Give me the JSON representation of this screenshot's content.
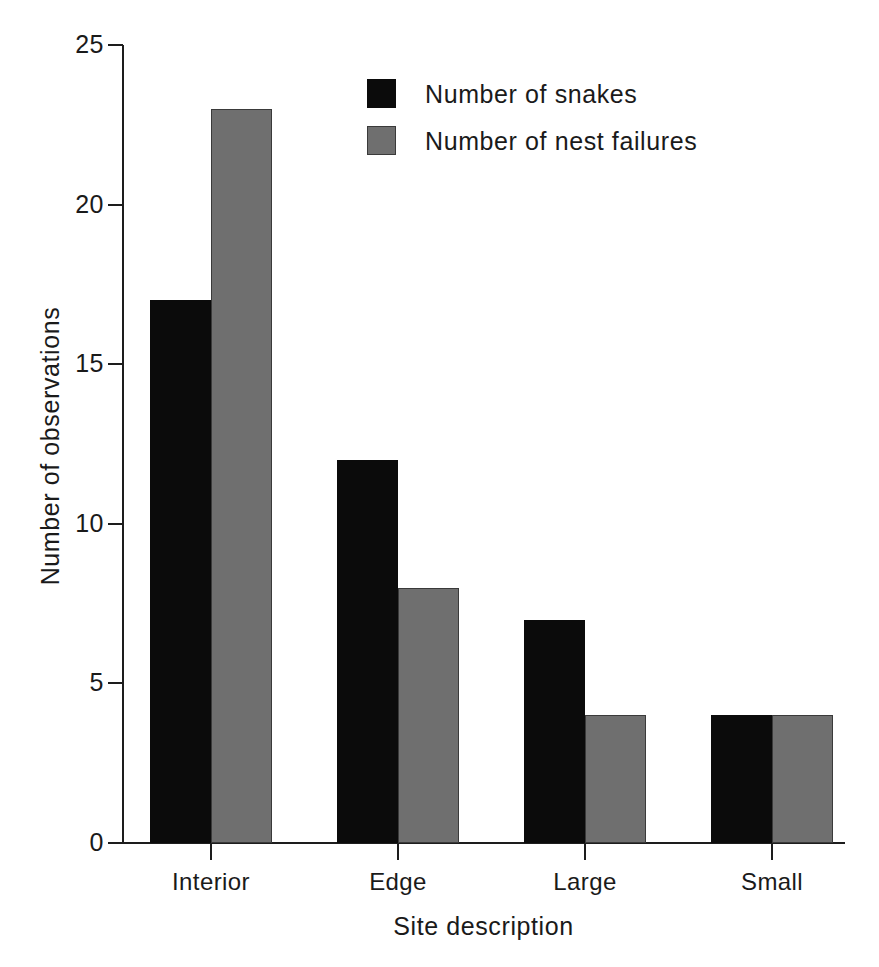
{
  "chart_data": {
    "type": "bar",
    "title": "",
    "xlabel": "Site description",
    "ylabel": "Number of observations",
    "categories": [
      "Interior",
      "Edge",
      "Large",
      "Small"
    ],
    "series": [
      {
        "name": "Number of snakes",
        "color": "#0b0b0b",
        "values": [
          17,
          12,
          7,
          4
        ]
      },
      {
        "name": "Number of nest failures",
        "color": "#6f6f6f",
        "values": [
          23,
          8,
          4,
          4
        ]
      }
    ],
    "ylim": [
      0,
      25
    ],
    "yticks": [
      0,
      5,
      10,
      15,
      20,
      25
    ],
    "ytick_labels": [
      "0",
      "5",
      "10",
      "15",
      "20",
      "25"
    ],
    "grid": false,
    "legend_position": "top-center",
    "bar_group_mode": "grouped-adjacent"
  },
  "axes": {
    "y_title": "Number of observations",
    "x_title": "Site description"
  },
  "legend": {
    "items": [
      {
        "label": "Number of snakes",
        "swatch": "black-square-swatch"
      },
      {
        "label": "Number of nest failures",
        "swatch": "gray-square-swatch"
      }
    ]
  }
}
